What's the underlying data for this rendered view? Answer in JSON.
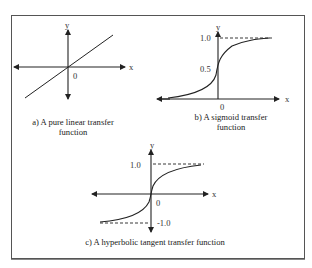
{
  "panels": {
    "a": {
      "caption_line1": "a) A pure linear transfer",
      "caption_line2": "function",
      "y_label": "y",
      "x_label": "x",
      "origin_label": "0"
    },
    "b": {
      "caption_line1": "b) A sigmoid transfer",
      "caption_line2": "function",
      "y_label": "y",
      "x_label": "x",
      "origin_label": "0",
      "tick_upper": "1.0",
      "tick_mid": "0.5"
    },
    "c": {
      "caption": "c) A hyperbolic tangent transfer function",
      "y_label": "y",
      "x_label": "x",
      "origin_label": "0",
      "tick_upper": "1.0",
      "tick_lower": "-1.0"
    }
  },
  "colors": {
    "line": "#222222",
    "frame": "#555555",
    "background": "#ffffff"
  }
}
